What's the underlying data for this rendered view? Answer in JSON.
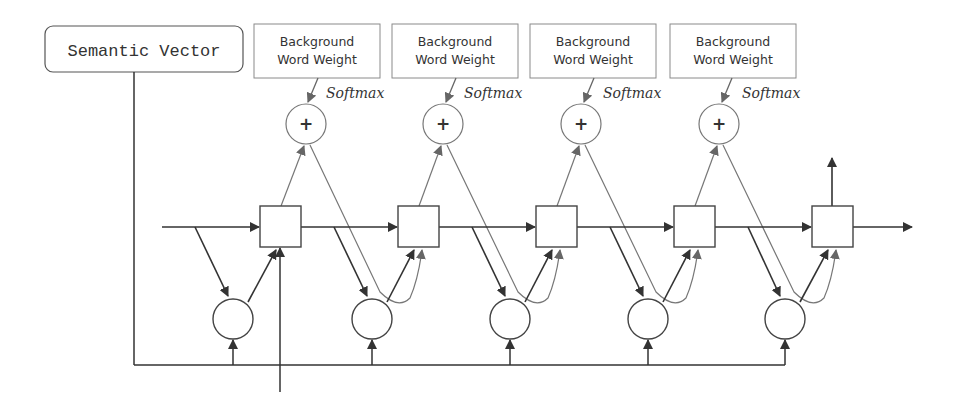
{
  "diagram": {
    "semantic_vector": {
      "label": "Semantic Vector"
    },
    "background_boxes": [
      {
        "line1": "Background",
        "line2": "Word Weight",
        "softmax": "Softmax"
      },
      {
        "line1": "Background",
        "line2": "Word Weight",
        "softmax": "Softmax"
      },
      {
        "line1": "Background",
        "line2": "Word Weight",
        "softmax": "Softmax"
      },
      {
        "line1": "Background",
        "line2": "Word Weight",
        "softmax": "Softmax"
      }
    ],
    "plus_nodes": [
      {
        "symbol": "+"
      },
      {
        "symbol": "+"
      },
      {
        "symbol": "+"
      },
      {
        "symbol": "+"
      }
    ],
    "cell_count": 5,
    "colors": {
      "stroke": "#3a3a3a",
      "light_stroke": "#777777",
      "box_border": "#8a8a8a",
      "background": "#ffffff"
    }
  }
}
